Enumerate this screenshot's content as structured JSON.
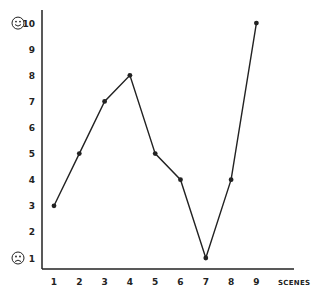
{
  "chart_data": {
    "type": "line",
    "title": "",
    "xlabel": "SCENES",
    "ylabel": "",
    "categories": [
      "1",
      "2",
      "3",
      "4",
      "5",
      "6",
      "7",
      "8",
      "9"
    ],
    "x": [
      1,
      2,
      3,
      4,
      5,
      6,
      7,
      8,
      9
    ],
    "values": [
      3,
      5,
      7,
      8,
      5,
      4,
      1,
      4,
      10
    ],
    "y_ticks": [
      "1",
      "2",
      "3",
      "4",
      "5",
      "6",
      "7",
      "8",
      "9",
      "10"
    ],
    "ylim": [
      1,
      10
    ],
    "grid": false,
    "legend": null,
    "annotations": [
      {
        "at_y": 10,
        "icon": "happy-face-icon",
        "glyph": "☺"
      },
      {
        "at_y": 1,
        "icon": "sad-face-icon",
        "glyph": "☹"
      }
    ],
    "line_color": "#222222",
    "marker": "filled-circle"
  }
}
